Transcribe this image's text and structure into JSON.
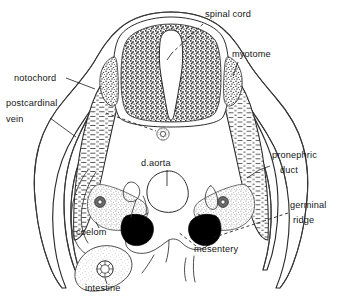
{
  "figure": {
    "background_color": "#ffffff",
    "ink_color": "#1a1a1a",
    "fill_black": "#000000"
  },
  "labels": [
    {
      "id": "spinal-cord",
      "text": "spinal cord",
      "x": 205,
      "y": 17,
      "anchor": "start"
    },
    {
      "id": "myotome",
      "text": "myotome",
      "x": 232,
      "y": 57,
      "anchor": "start"
    },
    {
      "id": "notochord",
      "text": "notochord",
      "x": 14,
      "y": 81,
      "anchor": "start"
    },
    {
      "id": "postcardinal",
      "text": "postcardinal",
      "x": 6,
      "y": 106,
      "anchor": "start"
    },
    {
      "id": "vein",
      "text": "vein",
      "x": 6,
      "y": 122,
      "anchor": "start"
    },
    {
      "id": "d-aorta",
      "text": "d.aorta",
      "x": 141,
      "y": 166,
      "anchor": "start"
    },
    {
      "id": "pronephric",
      "text": "pronephric",
      "x": 272,
      "y": 158,
      "anchor": "start"
    },
    {
      "id": "duct",
      "text": "duct",
      "x": 280,
      "y": 173,
      "anchor": "start"
    },
    {
      "id": "germinal",
      "text": "germinal",
      "x": 290,
      "y": 208,
      "anchor": "start"
    },
    {
      "id": "ridge",
      "text": "ridge",
      "x": 293,
      "y": 223,
      "anchor": "start"
    },
    {
      "id": "coelom",
      "text": "coelom",
      "x": 76,
      "y": 235,
      "anchor": "start"
    },
    {
      "id": "mesentery",
      "text": "mesentery",
      "x": 194,
      "y": 252,
      "anchor": "start"
    },
    {
      "id": "intestine",
      "text": "intestine",
      "x": 85,
      "y": 291,
      "anchor": "start"
    }
  ],
  "structures": [
    {
      "id": "body-wall",
      "name": "body wall outline"
    },
    {
      "id": "neural-tube",
      "name": "spinal cord / neural tube"
    },
    {
      "id": "neurocoel",
      "name": "central canal"
    },
    {
      "id": "spinal-ganglion-left",
      "name": "spinal ganglion left"
    },
    {
      "id": "spinal-ganglion-right",
      "name": "spinal ganglion right"
    },
    {
      "id": "myotome-left",
      "name": "myotome left"
    },
    {
      "id": "myotome-right",
      "name": "myotome right"
    },
    {
      "id": "notochord-circle",
      "name": "notochord"
    },
    {
      "id": "dorsal-aorta",
      "name": "dorsal aorta"
    },
    {
      "id": "germinal-ridge-left",
      "name": "germinal ridge left"
    },
    {
      "id": "germinal-ridge-right",
      "name": "germinal ridge right"
    },
    {
      "id": "pronephric-tubule-left",
      "name": "pronephric tubule left"
    },
    {
      "id": "pronephric-tubule-right",
      "name": "pronephric tubule right"
    },
    {
      "id": "coelom-cavity",
      "name": "coelom"
    },
    {
      "id": "intestine-lumen",
      "name": "intestine"
    },
    {
      "id": "mesentery-fold",
      "name": "mesentery"
    }
  ]
}
